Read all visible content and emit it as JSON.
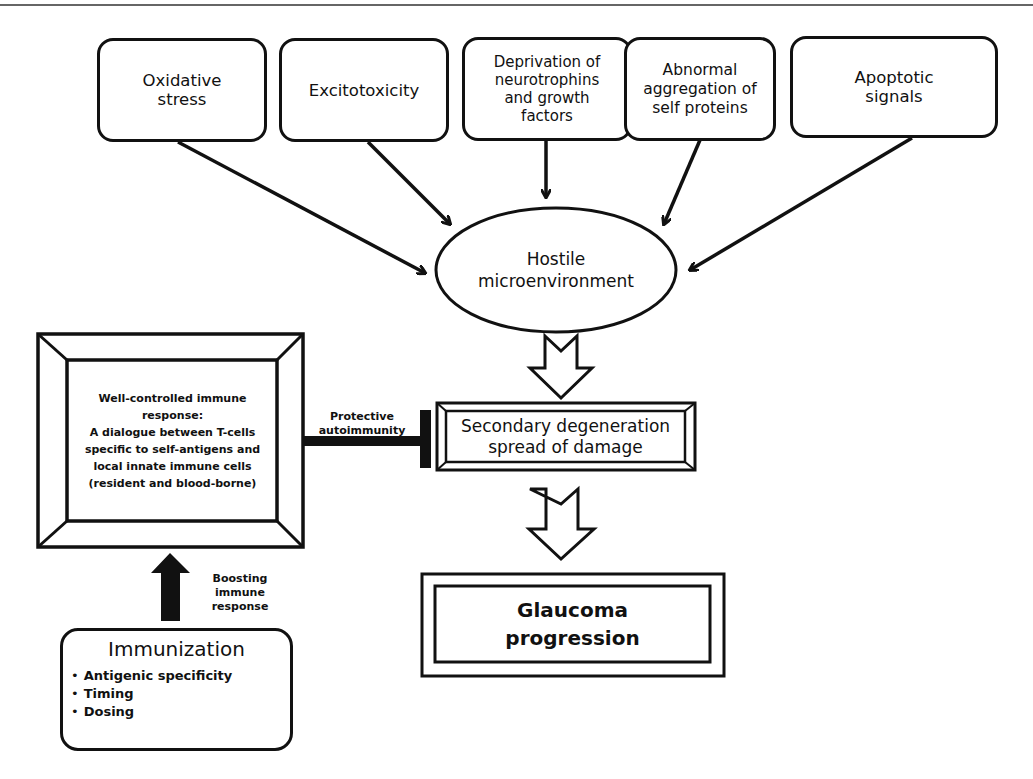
{
  "diagram": {
    "type": "flowchart",
    "causes": [
      {
        "id": "oxidative",
        "label": "Oxidative\nstress"
      },
      {
        "id": "excitotoxicity",
        "label": "Excitotoxicity"
      },
      {
        "id": "neurotrophins",
        "label": "Deprivation of\nneurotrophins\nand growth\nfactors"
      },
      {
        "id": "aggregation",
        "label": "Abnormal\naggregation of\nself proteins"
      },
      {
        "id": "apoptotic",
        "label": "Apoptotic\nsignals"
      }
    ],
    "hub": {
      "label": "Hostile\nmicroenvironment"
    },
    "secondary": {
      "label": "Secondary degeneration\nspread of damage"
    },
    "outcome": {
      "label": "Glaucoma\nprogression"
    },
    "immune_response": {
      "label": "Well-controlled immune\nresponse:\nA dialogue between T-cells\nspecific to self-antigens and\nlocal innate immune cells\n(resident and blood-borne)"
    },
    "inhibition_label": "Protective\nautoimmunity",
    "boost_label": "Boosting\nimmune\nresponse",
    "immunization": {
      "title": "Immunization",
      "items": [
        "Antigenic specificity",
        "Timing",
        "Dosing"
      ]
    },
    "edges": [
      {
        "from": "oxidative",
        "to": "hub",
        "type": "arrow"
      },
      {
        "from": "excitotoxicity",
        "to": "hub",
        "type": "arrow"
      },
      {
        "from": "neurotrophins",
        "to": "hub",
        "type": "arrow"
      },
      {
        "from": "aggregation",
        "to": "hub",
        "type": "arrow"
      },
      {
        "from": "apoptotic",
        "to": "hub",
        "type": "arrow"
      },
      {
        "from": "hub",
        "to": "secondary",
        "type": "hollow-arrow"
      },
      {
        "from": "secondary",
        "to": "outcome",
        "type": "hollow-arrow"
      },
      {
        "from": "immune_response",
        "to": "secondary",
        "type": "inhibition",
        "label": "Protective autoimmunity"
      },
      {
        "from": "immunization",
        "to": "immune_response",
        "type": "solid-arrow",
        "label": "Boosting immune response"
      }
    ]
  }
}
